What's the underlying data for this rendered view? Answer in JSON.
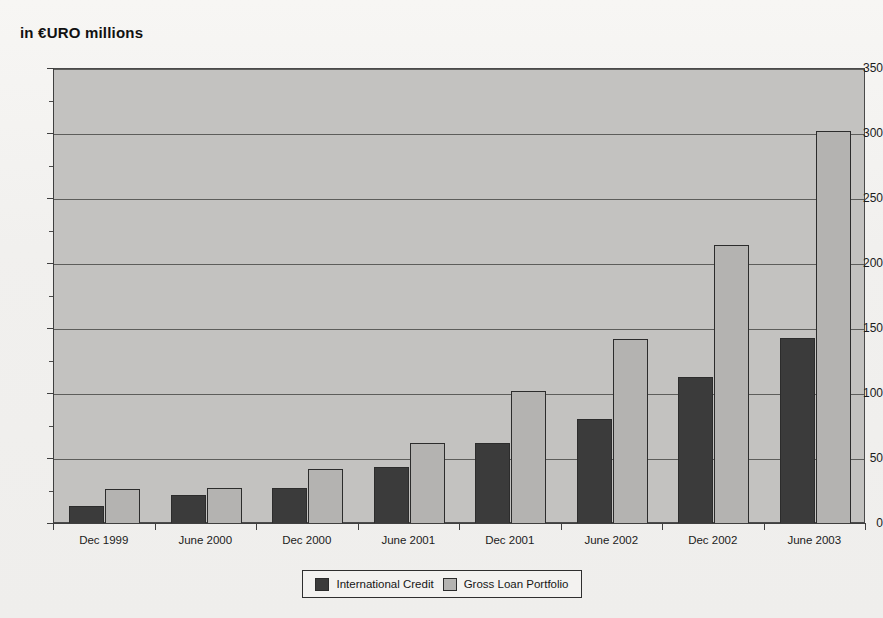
{
  "chart_data": {
    "type": "bar",
    "title": "in €URO millions",
    "xlabel": "",
    "ylabel": "",
    "ylim": [
      0,
      350
    ],
    "ytick_step": 50,
    "yticks": [
      0,
      50,
      100,
      150,
      200,
      250,
      300,
      350
    ],
    "ytick_labels": [
      "0",
      "50",
      "100",
      "150",
      "200",
      "250",
      "300",
      "350"
    ],
    "grid": true,
    "grid_axis": "y",
    "legend_position": "bottom-center",
    "categories": [
      "Dec 1999",
      "June 2000",
      "Dec 2000",
      "June 2001",
      "Dec 2001",
      "June 2002",
      "Dec 2002",
      "June 2003"
    ],
    "series": [
      {
        "name": "International Credit",
        "color": "#3b3b3b",
        "values": [
          14,
          22,
          28,
          44,
          62,
          81,
          113,
          143
        ]
      },
      {
        "name": "Gross Loan Portfolio",
        "color": "#b4b3b1",
        "values": [
          27,
          28,
          42,
          62,
          102,
          142,
          215,
          302
        ]
      }
    ]
  },
  "legend": {
    "entries": [
      {
        "label": "International Credit"
      },
      {
        "label": "Gross Loan Portfolio"
      }
    ]
  },
  "colors": {
    "plot_background": "#c3c2c0",
    "figure_background": "#f1f0ee",
    "axis": "#3f3f3f",
    "gridline": "#5d5d5b",
    "series_dark": "#3b3b3b",
    "series_light": "#b4b3b1"
  }
}
